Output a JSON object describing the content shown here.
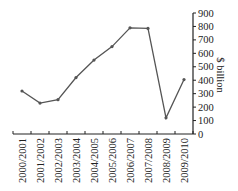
{
  "chart_data": {
    "type": "line",
    "title": "",
    "xlabel": "",
    "ylabel": "$ billion",
    "ylim": [
      0,
      900
    ],
    "yticks": [
      0,
      100,
      200,
      300,
      400,
      500,
      600,
      700,
      800,
      900
    ],
    "y_axis_position": "right",
    "grid": false,
    "legend": null,
    "categories": [
      "2000/2001",
      "2001/2002",
      "2002/2003",
      "2003/2004",
      "2004/2005",
      "2005/2006",
      "2006/2007",
      "2007/2008",
      "2008/2009",
      "2009/2010"
    ],
    "series": [
      {
        "name": "$ billion",
        "color": "#555555",
        "values": [
          320,
          230,
          255,
          420,
          550,
          650,
          790,
          785,
          120,
          405
        ]
      }
    ]
  }
}
